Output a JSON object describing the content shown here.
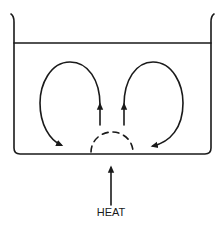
{
  "diagram": {
    "heat_label": "HEAT",
    "colors": {
      "line": "#1a1a1a",
      "background": "#ffffff"
    },
    "elements": {
      "container": "beaker",
      "liquid_surface": "surface-line",
      "left_current": "convection-loop-left",
      "right_current": "convection-loop-right",
      "heat_zone": "dashed-semicircle",
      "heat_arrow": "upward-arrow"
    }
  }
}
